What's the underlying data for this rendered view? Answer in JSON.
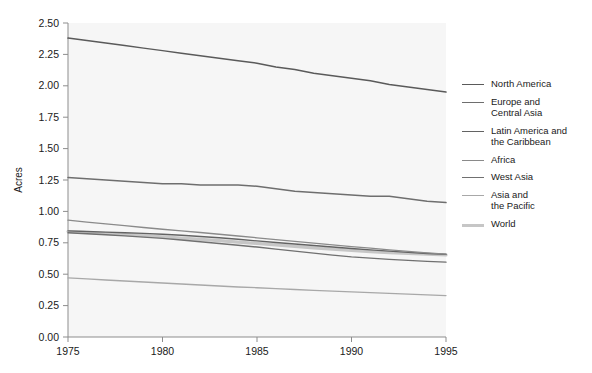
{
  "chart_data": {
    "type": "line",
    "title": "",
    "xlabel": "",
    "ylabel": "Acres",
    "xlim": [
      1975,
      1995
    ],
    "ylim": [
      0.0,
      2.5
    ],
    "xticks": [
      "1975",
      "1980",
      "1985",
      "1990",
      "1995"
    ],
    "yticks": [
      "0.00",
      "0.25",
      "0.50",
      "0.75",
      "1.00",
      "1.25",
      "1.50",
      "1.75",
      "2.00",
      "2.25",
      "2.50"
    ],
    "grid": false,
    "legend_position": "right",
    "x": [
      1975,
      1976,
      1977,
      1978,
      1979,
      1980,
      1981,
      1982,
      1983,
      1984,
      1985,
      1986,
      1987,
      1988,
      1989,
      1990,
      1991,
      1992,
      1993,
      1994,
      1995
    ],
    "series": [
      {
        "name": "North America",
        "color": "#5a5a5a",
        "width": 1.5,
        "values": [
          2.38,
          2.36,
          2.34,
          2.32,
          2.3,
          2.28,
          2.26,
          2.24,
          2.22,
          2.2,
          2.18,
          2.15,
          2.13,
          2.1,
          2.08,
          2.06,
          2.04,
          2.01,
          1.99,
          1.97,
          1.95
        ]
      },
      {
        "name": "Europe and\nCentral Asia",
        "color": "#6e6e6e",
        "width": 1.5,
        "values": [
          1.27,
          1.26,
          1.25,
          1.24,
          1.23,
          1.22,
          1.22,
          1.21,
          1.21,
          1.21,
          1.2,
          1.18,
          1.16,
          1.15,
          1.14,
          1.13,
          1.12,
          1.12,
          1.1,
          1.08,
          1.07
        ]
      },
      {
        "name": "Latin America and\nthe Caribbean",
        "color": "#636363",
        "width": 1.4,
        "values": [
          0.845,
          0.84,
          0.835,
          0.83,
          0.825,
          0.818,
          0.81,
          0.8,
          0.79,
          0.778,
          0.765,
          0.752,
          0.74,
          0.728,
          0.716,
          0.705,
          0.694,
          0.684,
          0.674,
          0.665,
          0.658
        ]
      },
      {
        "name": "Africa",
        "color": "#8a8a8a",
        "width": 1.3,
        "values": [
          0.93,
          0.915,
          0.9,
          0.886,
          0.872,
          0.858,
          0.845,
          0.832,
          0.818,
          0.804,
          0.79,
          0.776,
          0.762,
          0.748,
          0.734,
          0.72,
          0.707,
          0.694,
          0.682,
          0.67,
          0.66
        ]
      },
      {
        "name": "West Asia",
        "color": "#707070",
        "width": 1.4,
        "values": [
          0.83,
          0.822,
          0.814,
          0.805,
          0.795,
          0.785,
          0.772,
          0.758,
          0.744,
          0.73,
          0.716,
          0.7,
          0.684,
          0.668,
          0.652,
          0.638,
          0.628,
          0.618,
          0.61,
          0.602,
          0.596
        ]
      },
      {
        "name": "Asia and\nthe Pacific",
        "color": "#a8a8a8",
        "width": 1.3,
        "values": [
          0.47,
          0.462,
          0.454,
          0.446,
          0.438,
          0.43,
          0.422,
          0.414,
          0.406,
          0.398,
          0.392,
          0.385,
          0.378,
          0.372,
          0.366,
          0.36,
          0.354,
          0.348,
          0.342,
          0.336,
          0.33
        ]
      },
      {
        "name": "World",
        "color": "#c6c6c6",
        "width": 3.2,
        "values": [
          0.84,
          0.832,
          0.824,
          0.816,
          0.807,
          0.798,
          0.788,
          0.778,
          0.767,
          0.756,
          0.745,
          0.733,
          0.721,
          0.71,
          0.699,
          0.689,
          0.68,
          0.672,
          0.665,
          0.659,
          0.654
        ]
      }
    ]
  },
  "legend": {
    "items": [
      {
        "label": "North America"
      },
      {
        "label": "Europe and\nCentral Asia"
      },
      {
        "label": "Latin America and\nthe Caribbean"
      },
      {
        "label": "Africa"
      },
      {
        "label": "West Asia"
      },
      {
        "label": "Asia and\nthe Pacific"
      },
      {
        "label": "World"
      }
    ]
  },
  "style": {
    "plot_background": "#f6f6f6",
    "axis_color": "#8d8d8d",
    "tick_label_color": "#1a1a1a",
    "page_background": "#ffffff"
  }
}
